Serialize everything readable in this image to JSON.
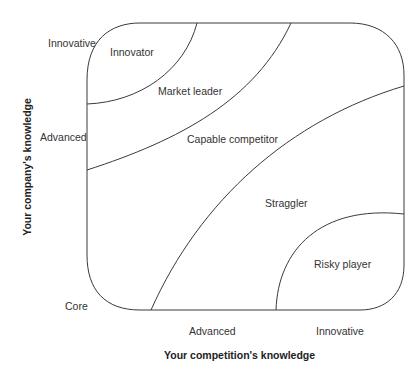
{
  "diagram": {
    "type": "knowledge-position-matrix",
    "x_axis": {
      "title": "Your competition's knowledge",
      "ticks": [
        "Core",
        "Advanced",
        "Innovative"
      ]
    },
    "y_axis": {
      "title": "Your company's knowledge",
      "ticks": [
        "Core",
        "Advanced",
        "Innovative"
      ]
    },
    "corner_label": "Core",
    "left_labels": {
      "innovative": "Innovative",
      "advanced": "Advanced"
    },
    "bottom_labels": {
      "advanced": "Advanced",
      "innovative": "Innovative"
    },
    "regions": [
      {
        "id": "innovator",
        "label": "Innovator"
      },
      {
        "id": "market-leader",
        "label": "Market leader"
      },
      {
        "id": "capable-competitor",
        "label": "Capable competitor"
      },
      {
        "id": "straggler",
        "label": "Straggler"
      },
      {
        "id": "risky-player",
        "label": "Risky player"
      }
    ],
    "line_color": "#3a3a3a"
  }
}
